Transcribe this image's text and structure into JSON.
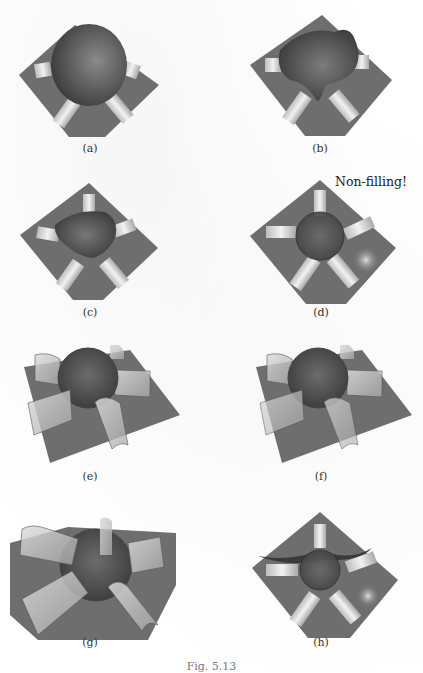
{
  "figure": {
    "panels": [
      {
        "id": "a",
        "label": "(a)"
      },
      {
        "id": "b",
        "label": "(b)"
      },
      {
        "id": "c",
        "label": "(c)"
      },
      {
        "id": "d",
        "label": "(d)",
        "annotation": "Non-filling!"
      },
      {
        "id": "e",
        "label": "(e)"
      },
      {
        "id": "f",
        "label": "(f)"
      },
      {
        "id": "g",
        "label": "(g)"
      },
      {
        "id": "h",
        "label": "(h)"
      }
    ],
    "caption": "Fig. 5.13"
  },
  "colors": {
    "plate": "#6e6e6e",
    "blob": "#5a5a5a",
    "tube": "#d9d9d9",
    "background": "#ffffff"
  }
}
